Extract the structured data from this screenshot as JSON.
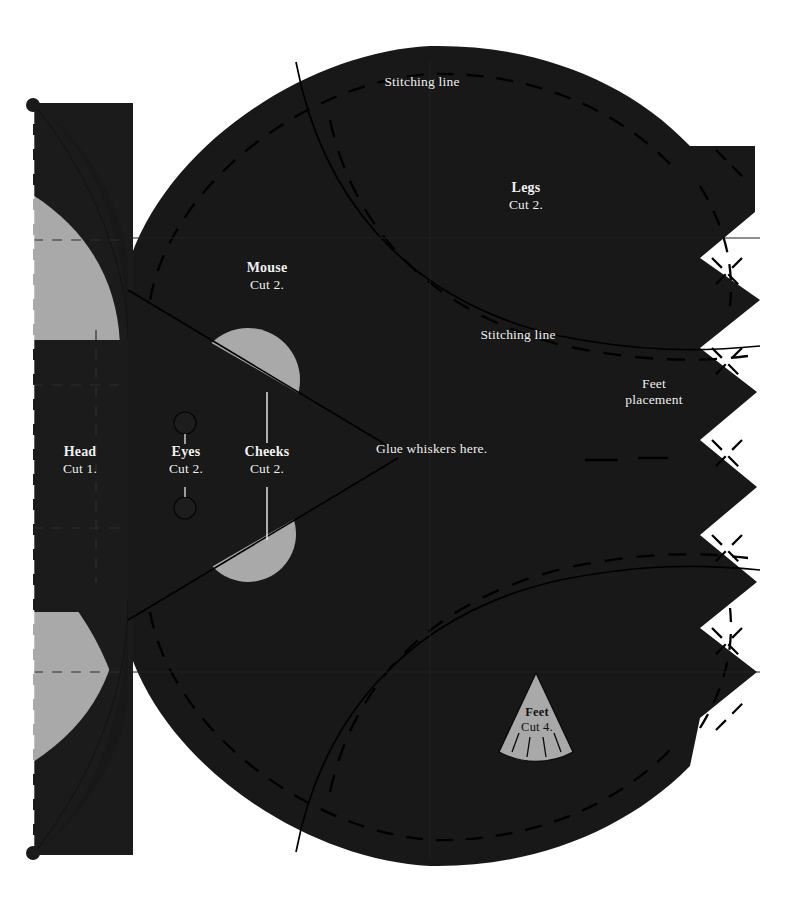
{
  "document": {
    "kind": "sewing-pattern-sheet",
    "title": "Mouse softie cut-and-sew pattern"
  },
  "colors": {
    "background": "#ffffff",
    "fabric_dark": "#181818",
    "fabric_dark_alt": "#1d1d1d",
    "piece_gray": "#a9a9a9",
    "label_light": "#f2f2f2",
    "label_dark": "#111111",
    "stitch_line": "#000000",
    "guide_line": "#2e2e2e"
  },
  "pieces": [
    {
      "id": "head",
      "title": "Head",
      "cut": "Cut 1."
    },
    {
      "id": "eyes",
      "title": "Eyes",
      "cut": "Cut 2."
    },
    {
      "id": "cheeks",
      "title": "Cheeks",
      "cut": "Cut 2."
    },
    {
      "id": "mouse",
      "title": "Mouse",
      "cut": "Cut 2."
    },
    {
      "id": "legs",
      "title": "Legs",
      "cut": "Cut 2."
    },
    {
      "id": "feet",
      "title": "Feet",
      "cut": "Cut 4."
    }
  ],
  "annotations": {
    "stitching_top": "Stitching line",
    "stitching_middle": "Stitching line",
    "feet_placement_line1": "Feet",
    "feet_placement_line2": "placement",
    "glue_whiskers": "Glue whiskers here."
  },
  "markings": {
    "fold_dot_top": "fold-dot",
    "fold_dot_bottom": "fold-dot",
    "fold_line": "fold-line-dashed",
    "eye_circles": 2,
    "feet_tick_marks": 4,
    "right_edge_notches": 4
  }
}
